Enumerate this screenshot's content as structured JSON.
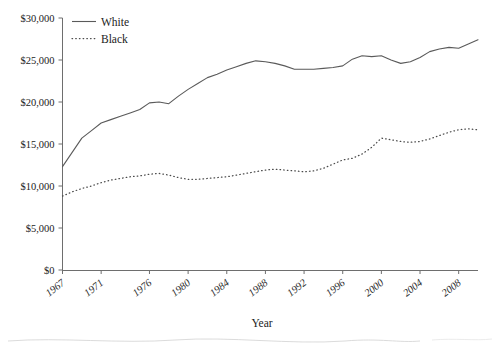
{
  "chart_data": {
    "type": "line",
    "title": "",
    "xlabel": "Year",
    "ylabel": "",
    "grid": false,
    "legend_position": "top-left",
    "xlim": [
      1967,
      2010
    ],
    "ylim": [
      0,
      30000
    ],
    "x_tick_labels": [
      "1967",
      "1971",
      "1976",
      "1980",
      "1984",
      "1988",
      "1992",
      "1996",
      "2000",
      "2004",
      "2008"
    ],
    "x_tick_values": [
      1967,
      1971,
      1976,
      1980,
      1984,
      1988,
      1992,
      1996,
      2000,
      2004,
      2008
    ],
    "y_tick_labels": [
      "$0",
      "$5,000",
      "$10,000",
      "$15,000",
      "$20,000",
      "$25,000",
      "$30,000"
    ],
    "y_tick_values": [
      0,
      5000,
      10000,
      15000,
      20000,
      25000,
      30000
    ],
    "x": [
      1967,
      1968,
      1969,
      1970,
      1971,
      1972,
      1973,
      1974,
      1975,
      1976,
      1977,
      1978,
      1979,
      1980,
      1981,
      1982,
      1983,
      1984,
      1985,
      1986,
      1987,
      1988,
      1989,
      1990,
      1991,
      1992,
      1993,
      1994,
      1995,
      1996,
      1997,
      1998,
      1999,
      2000,
      2001,
      2002,
      2003,
      2004,
      2005,
      2006,
      2007,
      2008,
      2009,
      2010
    ],
    "series": [
      {
        "name": "White",
        "style": "solid",
        "color": "#5a5a5a",
        "values": [
          12300,
          14000,
          15700,
          16600,
          17500,
          17900,
          18300,
          18700,
          19100,
          19900,
          20000,
          19800,
          20700,
          21500,
          22200,
          22900,
          23300,
          23800,
          24200,
          24600,
          24900,
          24800,
          24600,
          24300,
          23900,
          23900,
          23900,
          24000,
          24100,
          24300,
          25100,
          25500,
          25400,
          25500,
          25000,
          24600,
          24800,
          25300,
          26000,
          26300,
          26500,
          26400,
          26900,
          27400
        ]
      },
      {
        "name": "Black",
        "style": "dotted",
        "color": "#4a4a4a",
        "values": [
          8800,
          9300,
          9700,
          10000,
          10400,
          10700,
          10900,
          11100,
          11200,
          11400,
          11500,
          11300,
          11000,
          10800,
          10800,
          10900,
          11000,
          11100,
          11300,
          11500,
          11700,
          11900,
          12000,
          11900,
          11800,
          11700,
          11800,
          12100,
          12600,
          13100,
          13300,
          13800,
          14600,
          15700,
          15500,
          15300,
          15200,
          15300,
          15600,
          16000,
          16400,
          16700,
          16800,
          16700
        ]
      }
    ]
  },
  "legend": {
    "entries": [
      {
        "label": "White",
        "style": "solid"
      },
      {
        "label": "Black",
        "style": "dotted"
      }
    ]
  },
  "axes": {
    "x_title": "Year",
    "y_title": ""
  }
}
